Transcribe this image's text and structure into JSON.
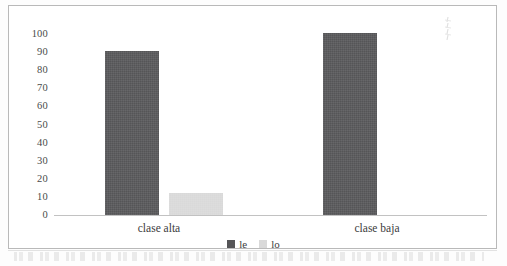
{
  "chart_data": {
    "type": "bar",
    "title": "",
    "subtitle": "",
    "xlabel": "",
    "ylabel": "",
    "categories": [
      "clase alta",
      "clase baja"
    ],
    "series": [
      {
        "name": "le",
        "values": [
          90,
          100
        ],
        "color": "#555557"
      },
      {
        "name": "lo",
        "values": [
          12,
          0
        ],
        "color": "#d9d9d9"
      }
    ],
    "ylim": [
      0,
      100
    ],
    "ytick_labels": [
      "100",
      "90",
      "80",
      "70",
      "60",
      "50",
      "40",
      "30",
      "20",
      "10",
      "0"
    ],
    "ytick_values": [
      100,
      90,
      80,
      70,
      60,
      50,
      40,
      30,
      20,
      10,
      0
    ],
    "grid": false,
    "legend_position": "bottom",
    "annotations": []
  },
  "legend": {
    "items": [
      {
        "label": "le",
        "color": "#555557"
      },
      {
        "label": "lo",
        "color": "#d9d9d9"
      }
    ]
  },
  "colors": {
    "series_le": "#555557",
    "series_lo": "#d9d9d9",
    "frame_border": "#b9b9b9",
    "axis_line": "#c2c2c2",
    "text": "#3c3c3c",
    "page_background": "#fdfdfd"
  }
}
